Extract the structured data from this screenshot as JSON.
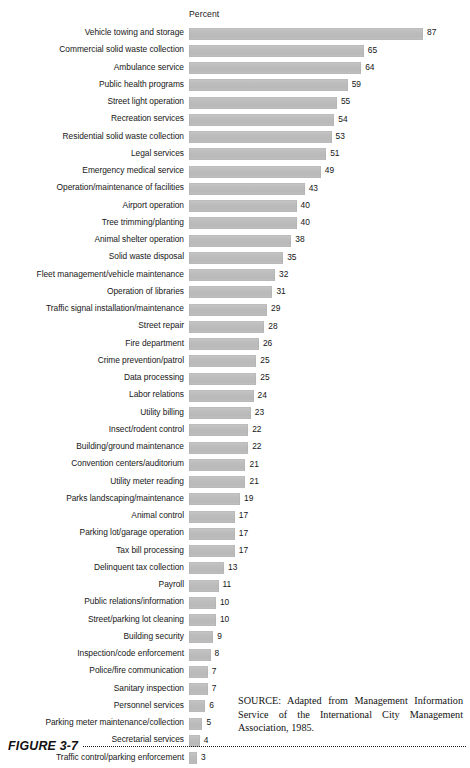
{
  "axis": {
    "title": "Percent"
  },
  "source": {
    "text": "SOURCE: Adapted from Management Information Service of the International City Management Association, 1985."
  },
  "footer": {
    "figure_number": "FIGURE 3-7"
  },
  "style": {
    "bar_color": "#bfbfbf",
    "text_color": "#171717",
    "background": "#ffffff"
  },
  "chart_data": {
    "type": "bar",
    "orientation": "horizontal",
    "title": "",
    "subtitle": "",
    "xlabel": "Percent",
    "ylabel": "",
    "xlim": [
      0,
      87
    ],
    "grid": false,
    "legend": false,
    "value_labels": true,
    "sorted": "descending",
    "categories": [
      "Vehicle towing and storage",
      "Commercial solid waste collection",
      "Ambulance service",
      "Public health programs",
      "Street light operation",
      "Recreation services",
      "Residential solid waste collection",
      "Legal services",
      "Emergency medical service",
      "Operation/maintenance of facilities",
      "Airport operation",
      "Tree trimming/planting",
      "Animal shelter operation",
      "Solid waste disposal",
      "Fleet management/vehicle maintenance",
      "Operation of libraries",
      "Traffic signal installation/maintenance",
      "Street repair",
      "Fire department",
      "Crime prevention/patrol",
      "Data processing",
      "Labor relations",
      "Utility billing",
      "Insect/rodent control",
      "Building/ground maintenance",
      "Convention centers/auditorium",
      "Utility meter reading",
      "Parks landscaping/maintenance",
      "Animal control",
      "Parking lot/garage operation",
      "Tax bill processing",
      "Delinquent tax collection",
      "Payroll",
      "Public relations/information",
      "Street/parking lot cleaning",
      "Building security",
      "Inspection/code enforcement",
      "Police/fire communication",
      "Sanitary inspection",
      "Personnel services",
      "Parking meter maintenance/collection",
      "Secretarial services",
      "Traffic control/parking enforcement"
    ],
    "values": [
      87,
      65,
      64,
      59,
      55,
      54,
      53,
      51,
      49,
      43,
      40,
      40,
      38,
      35,
      32,
      31,
      29,
      28,
      26,
      25,
      25,
      24,
      23,
      22,
      22,
      21,
      21,
      19,
      17,
      17,
      17,
      13,
      11,
      10,
      10,
      9,
      8,
      7,
      7,
      6,
      5,
      4,
      3
    ]
  }
}
